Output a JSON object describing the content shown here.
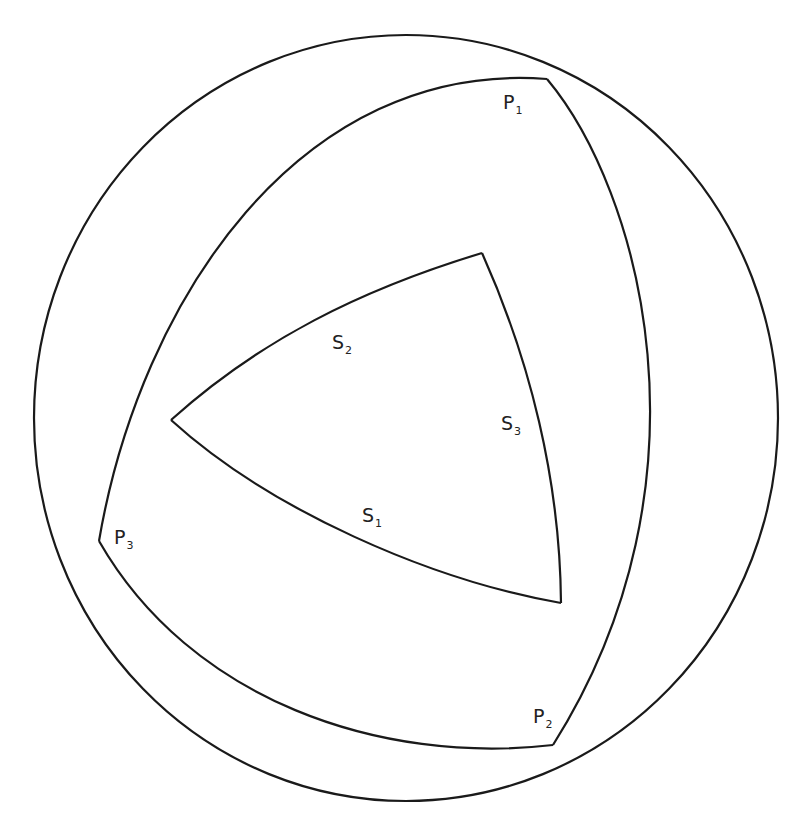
{
  "diagram": {
    "type": "spherical-triangles",
    "colors": {
      "background": "#ffffff",
      "stroke": "#1a1a1a",
      "text": "#222222"
    },
    "sphere": {
      "cx": 406,
      "cy": 418,
      "rx": 372,
      "ry": 383
    },
    "outer_triangle": {
      "vertices": [
        {
          "name": "P",
          "sub": "1",
          "x": 547,
          "y": 79
        },
        {
          "name": "P",
          "sub": "2",
          "x": 553,
          "y": 745
        },
        {
          "name": "P",
          "sub": "3",
          "x": 99,
          "y": 541
        }
      ]
    },
    "inner_triangle": {
      "vertices": [
        {
          "x": 482,
          "y": 253
        },
        {
          "x": 561,
          "y": 603
        },
        {
          "x": 171,
          "y": 420
        }
      ],
      "sides": [
        {
          "name": "S",
          "sub": "1"
        },
        {
          "name": "S",
          "sub": "2"
        },
        {
          "name": "S",
          "sub": "3"
        }
      ]
    },
    "labels": {
      "p1": {
        "main": "P",
        "sub": "1"
      },
      "p2": {
        "main": "P",
        "sub": "2"
      },
      "p3": {
        "main": "P",
        "sub": "3"
      },
      "s1": {
        "main": "S",
        "sub": "1"
      },
      "s2": {
        "main": "S",
        "sub": "2"
      },
      "s3": {
        "main": "S",
        "sub": "3"
      }
    }
  }
}
